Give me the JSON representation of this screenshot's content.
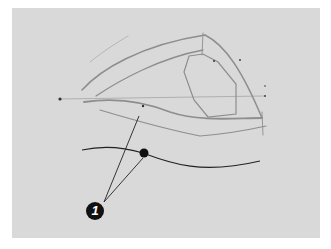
{
  "illustration": {
    "subject": "pencil sketch of an eye",
    "background_color": "#ffffff",
    "panel_color": "#d9d9d9",
    "pencil_color": "#8a8a8a",
    "ink_color": "#111111"
  },
  "annotations": [
    {
      "number": "1",
      "target": "lower lid line"
    }
  ]
}
